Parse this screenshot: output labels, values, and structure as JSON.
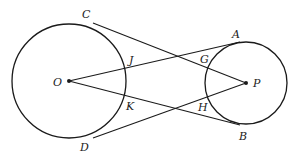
{
  "diagram": {
    "type": "two circles with crossing tangent-like segments",
    "stroke_color": "#1a1a1a",
    "circles": [
      {
        "name": "O",
        "cx": 69,
        "cy": 81,
        "r": 57
      },
      {
        "name": "P",
        "cx": 246,
        "cy": 83,
        "r": 41
      }
    ],
    "points": {
      "O": {
        "x": 69,
        "y": 81
      },
      "P": {
        "x": 246,
        "y": 83
      },
      "C": {
        "x": 93,
        "y": 23
      },
      "D": {
        "x": 93,
        "y": 138
      },
      "A": {
        "x": 240,
        "y": 42
      },
      "B": {
        "x": 240,
        "y": 125
      },
      "J": {
        "x": 125,
        "y": 69
      },
      "K": {
        "x": 124,
        "y": 95
      },
      "G": {
        "x": 206,
        "y": 73
      },
      "H": {
        "x": 206,
        "y": 95
      }
    },
    "labels": [
      {
        "text": "C",
        "x": 82,
        "y": 18
      },
      {
        "text": "A",
        "x": 232,
        "y": 38
      },
      {
        "text": "J",
        "x": 129,
        "y": 64
      },
      {
        "text": "G",
        "x": 200,
        "y": 63
      },
      {
        "text": "O",
        "x": 53,
        "y": 86
      },
      {
        "text": "P",
        "x": 253,
        "y": 87
      },
      {
        "text": "K",
        "x": 126,
        "y": 110
      },
      {
        "text": "H",
        "x": 198,
        "y": 111
      },
      {
        "text": "D",
        "x": 80,
        "y": 151
      },
      {
        "text": "B",
        "x": 239,
        "y": 140
      }
    ]
  }
}
